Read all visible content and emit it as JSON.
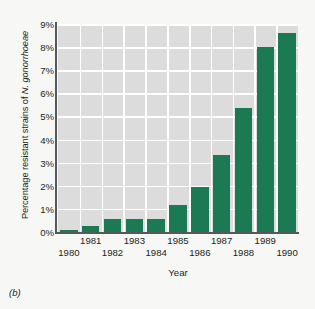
{
  "figure": {
    "panel_label": "(b)"
  },
  "axes": {
    "y_title_prefix": "Percentage resistant strains of ",
    "y_title_species": "N. gonorrhoeae",
    "x_title": "Year"
  },
  "chart_data": {
    "type": "bar",
    "title": "",
    "xlabel": "Year",
    "ylabel": "Percentage resistant strains of N. gonorrhoeae",
    "categories": [
      "1980",
      "1981",
      "1982",
      "1983",
      "1984",
      "1985",
      "1986",
      "1987",
      "1988",
      "1989",
      "1990"
    ],
    "values": [
      0.1,
      0.28,
      0.55,
      0.55,
      0.55,
      1.15,
      1.95,
      3.35,
      5.35,
      8.0,
      8.6
    ],
    "value_labels": [
      "0.1%",
      "0.28%",
      "0.55%",
      "0.55%",
      "0.55%",
      "1.15%",
      "1.95%",
      "3.35%",
      "5.35%",
      "8.0%",
      "8.6%"
    ],
    "ylim": [
      0,
      9
    ],
    "ytick_values": [
      0,
      1,
      2,
      3,
      4,
      5,
      6,
      7,
      8,
      9
    ],
    "ytick_labels": [
      "0%",
      "1%",
      "2%",
      "3%",
      "4%",
      "5%",
      "6%",
      "7%",
      "8%",
      "9%"
    ],
    "xtick_labels": [
      "1980",
      "1981",
      "1982",
      "1983",
      "1984",
      "1985",
      "1986",
      "1987",
      "1988",
      "1989",
      "1990"
    ],
    "grid": true,
    "grid_color": "#ffffff",
    "plot_background": "#dcdcdc",
    "bar_color": "#1b7a54",
    "legend": null,
    "legend_position": "none"
  }
}
